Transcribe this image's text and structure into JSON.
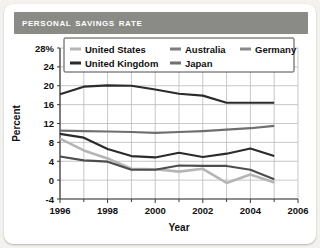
{
  "header": {
    "title": "Personal Savings Rate",
    "bar_color": "#8a8a87",
    "title_color": "#ffffff"
  },
  "chart_data": {
    "type": "line",
    "title": "Personal Savings Rate",
    "xlabel": "Year",
    "ylabel": "Percent",
    "xlim": [
      1996,
      2006
    ],
    "ylim": [
      -4,
      28
    ],
    "ytick_labels": [
      "28%",
      "24",
      "20",
      "16",
      "12",
      "8",
      "4",
      "0",
      "-4"
    ],
    "yticks": [
      28,
      24,
      20,
      16,
      12,
      8,
      4,
      0,
      -4
    ],
    "xtick_labels": [
      "1996",
      "1998",
      "2000",
      "2002",
      "2004",
      "2006"
    ],
    "xticks": [
      1996,
      1998,
      2000,
      2002,
      2004,
      2006
    ],
    "minor_xticks": [
      1997,
      1999,
      2001,
      2003,
      2005
    ],
    "grid": true,
    "legend_position": "top-inside",
    "x": [
      1996,
      1997,
      1998,
      1999,
      2000,
      2001,
      2002,
      2003,
      2004,
      2005
    ],
    "series": [
      {
        "name": "Japan",
        "color": "#2b2b2b",
        "width": 2.2,
        "values": [
          18.2,
          19.8,
          20.1,
          20.0,
          19.2,
          18.3,
          17.9,
          16.4,
          16.4,
          16.4
        ]
      },
      {
        "name": "Germany",
        "color": "#6f6f6f",
        "width": 2.2,
        "values": [
          10.5,
          10.4,
          10.3,
          10.2,
          10.0,
          10.2,
          10.4,
          10.7,
          11.0,
          11.5
        ]
      },
      {
        "name": "United Kingdom",
        "color": "#2b2b2b",
        "width": 2.2,
        "values": [
          9.8,
          9.0,
          6.6,
          5.1,
          4.8,
          5.8,
          4.9,
          5.6,
          6.7,
          5.1
        ]
      },
      {
        "name": "Australia",
        "color": "#4d4d4d",
        "width": 2.2,
        "values": [
          5.0,
          4.2,
          3.9,
          2.2,
          2.2,
          3.1,
          3.0,
          3.0,
          2.2,
          0.2
        ]
      },
      {
        "name": "United States",
        "color": "#b5b5b5",
        "width": 2.6,
        "values": [
          8.8,
          6.3,
          4.6,
          2.4,
          2.3,
          1.8,
          2.4,
          -0.6,
          1.2,
          -0.5
        ]
      }
    ],
    "legend": [
      {
        "label": "United States",
        "color": "#b5b5b5"
      },
      {
        "label": "Australia",
        "color": "#7d7d7d"
      },
      {
        "label": "Germany",
        "color": "#8a8a8a"
      },
      {
        "label": "United Kingdom",
        "color": "#2b2b2b"
      },
      {
        "label": "Japan",
        "color": "#6f6f6f"
      }
    ]
  }
}
